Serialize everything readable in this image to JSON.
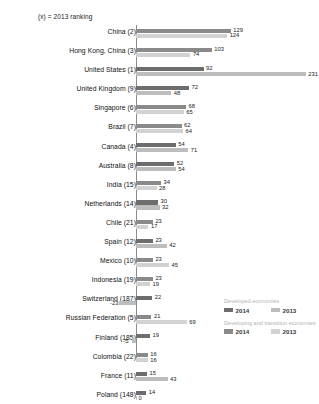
{
  "note": "(x) = 2013 ranking",
  "colors": {
    "developed_2014": "#6d6d6d",
    "developed_2013": "#bdbdbd",
    "developing_2014": "#8a8a8a",
    "developing_2013": "#d2d2d2",
    "axis": "#8c8c8c"
  },
  "legend": {
    "groups": [
      {
        "title": "Developed economies",
        "items": [
          {
            "label": "2014",
            "color": "#6d6d6d"
          },
          {
            "label": "2013",
            "color": "#bdbdbd"
          }
        ]
      },
      {
        "title": "Developing and transition economies",
        "items": [
          {
            "label": "2014",
            "color": "#8a8a8a"
          },
          {
            "label": "2013",
            "color": "#d2d2d2"
          }
        ]
      }
    ]
  },
  "chart_data": {
    "type": "bar",
    "orientation": "horizontal",
    "title": "",
    "subtitle": "(x) = 2013 ranking",
    "xlabel": "",
    "ylabel": "",
    "xlim": [
      -30,
      240
    ],
    "grid": false,
    "legend_position": "bottom-right",
    "series": [
      {
        "name": "2014",
        "values": [
          129,
          103,
          92,
          72,
          68,
          62,
          54,
          52,
          34,
          30,
          23,
          23,
          23,
          23,
          22,
          21,
          19,
          16,
          15,
          14
        ]
      },
      {
        "name": "2013",
        "values": [
          124,
          74,
          231,
          48,
          65,
          64,
          71,
          54,
          28,
          32,
          17,
          42,
          45,
          19,
          -23,
          69,
          -5,
          16,
          43,
          0
        ]
      }
    ],
    "categories": [
      "China (2)",
      "Hong Kong, China (3)",
      "United States (1)",
      "United Kingdom (9)",
      "Singapore (6)",
      "Brazil (7)",
      "Canada (4)",
      "Australia (8)",
      "India (15)",
      "Netherlands (14)",
      "Chile (21)",
      "Spain (12)",
      "Mexico (10)",
      "Indonesia (19)",
      "Switzerland (187)",
      "Russian Federation (5)",
      "Finland (185)",
      "Colombia (22)",
      "France (11)",
      "Poland (148)"
    ],
    "economy_type": [
      "developing",
      "developing",
      "developed",
      "developed",
      "developing",
      "developing",
      "developed",
      "developed",
      "developing",
      "developed",
      "developing",
      "developed",
      "developing",
      "developing",
      "developed",
      "developing",
      "developed",
      "developing",
      "developed",
      "developed"
    ]
  }
}
